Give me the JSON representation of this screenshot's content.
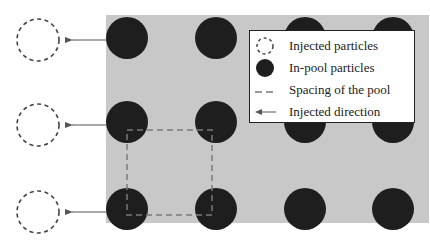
{
  "diagram": {
    "colors": {
      "pool_background": "#c8c8c8",
      "inpool_particle": "#1e1e1e",
      "injected_outline": "#444444",
      "spacing_line": "#7a7a7a",
      "arrow": "#555555"
    },
    "pool": {
      "x": 106,
      "y": 15,
      "width": 323,
      "height": 208
    },
    "inpool_particles": {
      "radius": 21,
      "columns_x": [
        127,
        216,
        305,
        393
      ],
      "rows_y": [
        38,
        122,
        209
      ]
    },
    "injected_particles": {
      "radius": 21,
      "x": 38,
      "rows_y": [
        40,
        125,
        212
      ]
    },
    "arrows": {
      "from_x": 106,
      "to_x": 65
    },
    "spacing_square": {
      "x1": 127,
      "y1": 130,
      "x2": 212,
      "y2": 215
    }
  },
  "legend": {
    "items": [
      {
        "symbol": "dashed-circle",
        "label": "Injected particles"
      },
      {
        "symbol": "filled-circle",
        "label": "In-pool particles"
      },
      {
        "symbol": "dashed-line",
        "label": "Spacing of the pool"
      },
      {
        "symbol": "arrow-left",
        "label": "Injected direction"
      }
    ]
  }
}
